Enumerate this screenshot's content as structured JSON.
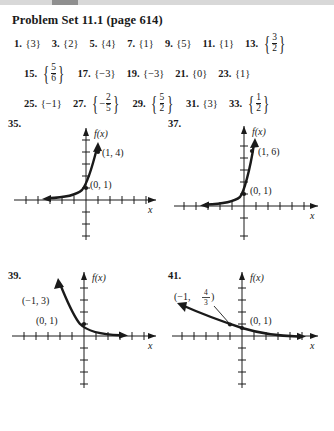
{
  "page": {
    "title": "Problem Set 11.1 (page 614)"
  },
  "answers": [
    [
      {
        "num": "1.",
        "kind": "set",
        "value": "3"
      },
      {
        "num": "3.",
        "kind": "set",
        "value": "2"
      },
      {
        "num": "5.",
        "kind": "set",
        "value": "4"
      },
      {
        "num": "7.",
        "kind": "set",
        "value": "1"
      },
      {
        "num": "9.",
        "kind": "set",
        "value": "5"
      },
      {
        "num": "11.",
        "kind": "set",
        "value": "1"
      },
      {
        "num": "13.",
        "kind": "setfrac",
        "numer": "3",
        "denom": "2"
      }
    ],
    [
      {
        "num": "15.",
        "kind": "setfrac",
        "numer": "5",
        "denom": "6"
      },
      {
        "num": "17.",
        "kind": "set",
        "value": "−3"
      },
      {
        "num": "19.",
        "kind": "set",
        "value": "−3"
      },
      {
        "num": "21.",
        "kind": "set",
        "value": "0"
      },
      {
        "num": "23.",
        "kind": "set",
        "value": "1"
      }
    ],
    [
      {
        "num": "25.",
        "kind": "set",
        "value": "−1"
      },
      {
        "num": "27.",
        "kind": "setfrac",
        "sign": "−",
        "numer": "2",
        "denom": "5"
      },
      {
        "num": "29.",
        "kind": "setfrac",
        "numer": "5",
        "denom": "2"
      },
      {
        "num": "31.",
        "kind": "set",
        "value": "3"
      },
      {
        "num": "33.",
        "kind": "setfrac",
        "numer": "1",
        "denom": "2"
      }
    ]
  ],
  "graphs": [
    {
      "num": "35.",
      "axis_label_y": "f(x)",
      "axis_label_x": "x",
      "points": [
        {
          "label": "(1, 4)",
          "dot": true
        },
        {
          "label": "(0, 1)",
          "dot": true
        }
      ],
      "shape": "growth-steep"
    },
    {
      "num": "37.",
      "axis_label_y": "f(x)",
      "axis_label_x": "x",
      "points": [
        {
          "label": "(1, 6)",
          "dot": true
        },
        {
          "label": "(0, 1)",
          "dot": true
        }
      ],
      "shape": "growth-steeper"
    },
    {
      "num": "39.",
      "axis_label_y": "f(x)",
      "axis_label_x": "x",
      "points": [
        {
          "label": "(−1, 3)",
          "dot": false
        },
        {
          "label": "(0, 1)",
          "dot": true
        }
      ],
      "shape": "decay-steep"
    },
    {
      "num": "41.",
      "axis_label_y": "f(x)",
      "axis_label_x": "x",
      "points": [
        {
          "label_prefix": "(−1,",
          "numer": "4",
          "denom": "3",
          "label_suffix": ")",
          "dot": true
        },
        {
          "label": "(0, 1)",
          "dot": true
        }
      ],
      "shape": "decay-gentle"
    }
  ],
  "chart_data": [
    {
      "type": "line",
      "id": "35",
      "title": "35.",
      "xlabel": "x",
      "ylabel": "f(x)",
      "function": "f(x) = 4^x",
      "marked_points": [
        [
          0,
          1
        ],
        [
          1,
          4
        ]
      ],
      "xlim": [
        -5,
        5
      ],
      "ylim": [
        -5,
        6
      ],
      "grid": false,
      "ticks": "unit tick marks on both axes"
    },
    {
      "type": "line",
      "id": "37",
      "title": "37.",
      "xlabel": "x",
      "ylabel": "f(x)",
      "function": "f(x) = 6^x",
      "marked_points": [
        [
          0,
          1
        ],
        [
          1,
          6
        ]
      ],
      "xlim": [
        -5,
        5
      ],
      "ylim": [
        -3,
        7
      ],
      "grid": false,
      "ticks": "unit tick marks on both axes"
    },
    {
      "type": "line",
      "id": "39",
      "title": "39.",
      "xlabel": "x",
      "ylabel": "f(x)",
      "function": "f(x) = (1/3)^x",
      "marked_points": [
        [
          -1,
          3
        ],
        [
          0,
          1
        ]
      ],
      "xlim": [
        -5,
        5
      ],
      "ylim": [
        -5,
        5
      ],
      "grid": false,
      "ticks": "unit tick marks on both axes"
    },
    {
      "type": "line",
      "id": "41",
      "title": "41.",
      "xlabel": "x",
      "ylabel": "f(x)",
      "function": "f(x) = (3/4)^x",
      "marked_points": [
        [
          -1,
          1.3333
        ],
        [
          0,
          1
        ]
      ],
      "xlim": [
        -5,
        5
      ],
      "ylim": [
        -5,
        5
      ],
      "grid": false,
      "ticks": "unit tick marks on both axes"
    }
  ]
}
